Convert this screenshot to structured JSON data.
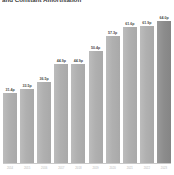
{
  "chart_data": {
    "type": "bar",
    "title": "and Constant Amortisation",
    "xlabel": "",
    "ylabel": "",
    "grid": false,
    "legend": null,
    "ylim": [
      0,
      70
    ],
    "categories": [
      "2014",
      "2015",
      "2016",
      "2017",
      "2018",
      "2019",
      "2020",
      "2021",
      "2022",
      "2023"
    ],
    "values": [
      31.4,
      33.5,
      36.5,
      44.9,
      44.9,
      50.4,
      57.3,
      61.6,
      61.9,
      64.0
    ],
    "value_labels": [
      "31.4p",
      "33.5p",
      "36.5p",
      "44.9p",
      "44.9p",
      "50.4p",
      "57.3p",
      "61.6p",
      "61.9p",
      "64.0p"
    ],
    "highlight_index": 9,
    "colors": {
      "bar": "#b3b3b3",
      "bar_highlight": "#8f8f8f",
      "value_label": "#4a4a4a",
      "axis": "#c9c9c9",
      "tick_label": "#b9b9b9",
      "title": "#3a3a3a",
      "background": "#ffffff"
    }
  }
}
